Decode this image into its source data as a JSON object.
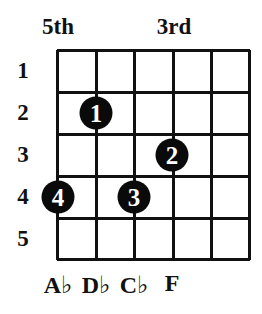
{
  "diagram": {
    "type": "chord-fingering-chart",
    "top_labels": [
      {
        "text": "5th",
        "x": 58
      },
      {
        "text": "3rd",
        "x": 174
      }
    ],
    "fret_numbers": [
      "1",
      "2",
      "3",
      "4",
      "5"
    ],
    "grid": {
      "columns": 5,
      "rows": 5,
      "x_lines": [
        57,
        96,
        134,
        173,
        211,
        250
      ],
      "y_lines": [
        50,
        92,
        134,
        176,
        218,
        260
      ]
    },
    "fingers": [
      {
        "finger": "1",
        "string_line": 1,
        "fret": 2,
        "x": 96,
        "y": 113
      },
      {
        "finger": "2",
        "string_line": 3,
        "fret": 3,
        "x": 172,
        "y": 155
      },
      {
        "finger": "3",
        "string_line": 2,
        "fret": 4,
        "x": 134,
        "y": 197
      },
      {
        "finger": "4",
        "string_line": 0,
        "fret": 4,
        "x": 58,
        "y": 197
      }
    ],
    "notes": [
      {
        "text": "A♭",
        "x": 58
      },
      {
        "text": "D♭",
        "x": 96
      },
      {
        "text": "C♭",
        "x": 134
      },
      {
        "text": "F",
        "x": 172
      }
    ],
    "colors": {
      "line": "#111111",
      "dot": "#0a0a0a",
      "dot_text": "#ffffff",
      "background": "#ffffff"
    }
  }
}
